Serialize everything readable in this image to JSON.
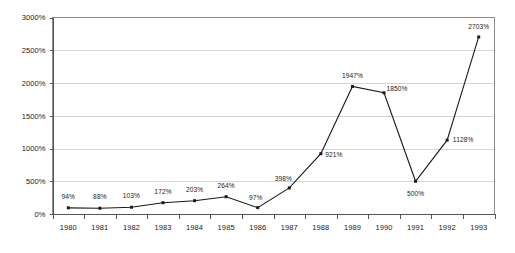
{
  "chart_data": {
    "type": "line",
    "title": "",
    "subtitle": "",
    "xlabel": "",
    "ylabel": "",
    "categories": [
      "1980",
      "1981",
      "1982",
      "1983",
      "1984",
      "1985",
      "1986",
      "1987",
      "1988",
      "1989",
      "1990",
      "1991",
      "1992",
      "1993"
    ],
    "values": [
      94,
      88,
      103,
      172,
      203,
      264,
      97,
      398,
      921,
      1947,
      1850,
      500,
      1128,
      2703
    ],
    "point_labels": [
      "94%",
      "88%",
      "103%",
      "172%",
      "203%",
      "264%",
      "97%",
      "398%",
      "921%",
      "1947%",
      "1850%",
      "500%",
      "1128%",
      "2703%"
    ],
    "series": [
      {
        "name": "",
        "values": [
          94,
          88,
          103,
          172,
          203,
          264,
          97,
          398,
          921,
          1947,
          1850,
          500,
          1128,
          2703
        ]
      }
    ],
    "ylim": [
      0,
      3000
    ],
    "ytick_values": [
      0,
      500,
      1000,
      1500,
      2000,
      2500,
      3000
    ],
    "ytick_labels": [
      "0%",
      "500%",
      "1000%",
      "1500%",
      "2000%",
      "2500%",
      "3000%"
    ],
    "grid": true,
    "legend": false,
    "legend_position": "none",
    "colors": {
      "line": "#1a1a1a",
      "marker": "#1a1a1a",
      "gridline": "#d4d4d4",
      "plot_border": "#8c8c8c",
      "axis": "#555555",
      "text": "#1a1a1a",
      "background": "#ffffff"
    },
    "label_offsets": [
      {
        "dx": 0,
        "dy": -9
      },
      {
        "dx": 0,
        "dy": -9
      },
      {
        "dx": 0,
        "dy": -9
      },
      {
        "dx": 0,
        "dy": -9
      },
      {
        "dx": 0,
        "dy": -9
      },
      {
        "dx": 0,
        "dy": -9
      },
      {
        "dx": -2,
        "dy": -8
      },
      {
        "dx": -6,
        "dy": -7
      },
      {
        "dx": 13,
        "dy": 3
      },
      {
        "dx": 0,
        "dy": -8
      },
      {
        "dx": 13,
        "dy": -2
      },
      {
        "dx": 0,
        "dy": 15
      },
      {
        "dx": 16,
        "dy": 2
      },
      {
        "dx": 0,
        "dy": -8
      }
    ]
  }
}
